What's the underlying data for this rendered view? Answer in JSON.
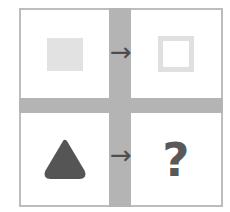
{
  "puzzle": {
    "type": "visual-analogy-matrix",
    "rows": 2,
    "columns": 2,
    "colors": {
      "frame_border": "#bdbdbd",
      "divider_band": "#b4b4b4",
      "light_shape": "#e2e2e2",
      "dark_shape": "#555555",
      "arrow": "#4d4d4d",
      "question_mark": "#595959",
      "background": "#ffffff"
    },
    "cells": [
      {
        "position": "top-left",
        "shape_name": "filled-square",
        "fill": "filled",
        "color": "#e2e2e2",
        "label": "square"
      },
      {
        "position": "top-right",
        "shape_name": "outlined-square",
        "fill": "outline",
        "color": "#e0e0e0",
        "label": "square"
      },
      {
        "position": "bottom-left",
        "shape_name": "filled-triangle",
        "fill": "filled",
        "color": "#555555",
        "label": "triangle"
      },
      {
        "position": "bottom-right",
        "shape_name": "question-mark",
        "fill": "unknown",
        "color": "#595959",
        "label": "?"
      }
    ],
    "arrows": [
      {
        "name": "arrow-top",
        "glyph": "→",
        "direction": "right"
      },
      {
        "name": "arrow-bottom",
        "glyph": "→",
        "direction": "right"
      }
    ]
  }
}
